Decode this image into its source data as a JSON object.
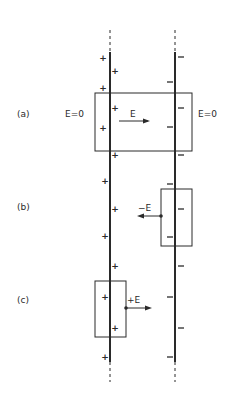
{
  "figure": {
    "panels": [
      {
        "id": "a",
        "label": "(a)",
        "field_left": "E=0",
        "field_inside": "E",
        "field_right": "E=0"
      },
      {
        "id": "b",
        "label": "(b)",
        "field_inside": "−E"
      },
      {
        "id": "c",
        "label": "(c)",
        "field_inside": "+E"
      }
    ],
    "left_plate": {
      "charge_symbol": "+",
      "x": 110
    },
    "right_plate": {
      "charge_symbol": "−",
      "x": 175
    },
    "plus_signs": [
      {
        "x": 103,
        "y": 58
      },
      {
        "x": 115,
        "y": 71
      },
      {
        "x": 103,
        "y": 88
      },
      {
        "x": 115,
        "y": 108
      },
      {
        "x": 103,
        "y": 128
      },
      {
        "x": 115,
        "y": 155
      },
      {
        "x": 105,
        "y": 181
      },
      {
        "x": 115,
        "y": 209
      },
      {
        "x": 105,
        "y": 236
      },
      {
        "x": 115,
        "y": 266
      },
      {
        "x": 105,
        "y": 297
      },
      {
        "x": 115,
        "y": 328
      },
      {
        "x": 105,
        "y": 357
      }
    ],
    "minus_signs": [
      {
        "x": 181,
        "y": 57
      },
      {
        "x": 170,
        "y": 82
      },
      {
        "x": 181,
        "y": 108
      },
      {
        "x": 170,
        "y": 127
      },
      {
        "x": 181,
        "y": 155
      },
      {
        "x": 170,
        "y": 184
      },
      {
        "x": 181,
        "y": 209
      },
      {
        "x": 170,
        "y": 237
      },
      {
        "x": 181,
        "y": 266
      },
      {
        "x": 170,
        "y": 297
      },
      {
        "x": 181,
        "y": 328
      },
      {
        "x": 170,
        "y": 357
      }
    ]
  }
}
